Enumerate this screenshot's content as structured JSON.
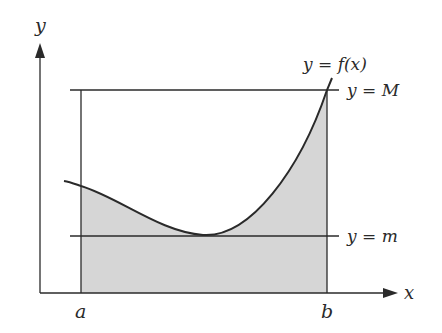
{
  "figure": {
    "axes": {
      "x_label": "x",
      "y_label": "y"
    },
    "bounds": {
      "a_label": "a",
      "b_label": "b"
    },
    "lines": {
      "upper": "y = M",
      "lower": "y = m"
    },
    "curve_label": "y = f(x)",
    "colors": {
      "stroke": "#2a2a2a",
      "shade": "#d6d6d6",
      "background": "#ffffff"
    }
  }
}
